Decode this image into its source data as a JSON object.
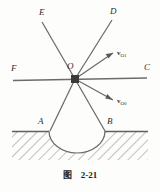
{
  "figure": {
    "caption_label": "图",
    "caption_number": "2-21",
    "type": "physics-ray-diagram"
  },
  "labels": {
    "E": "E",
    "D": "D",
    "F": "F",
    "C": "C",
    "O": "O",
    "A": "A",
    "B": "B"
  },
  "vectors": [
    {
      "name": "v_O1",
      "symbol": "v",
      "subscript": "O1",
      "direction": "up-right"
    },
    {
      "name": "v_O0",
      "symbol": "v",
      "subscript": "O0",
      "direction": "down-right"
    }
  ],
  "colors": {
    "line": "#6b6b6b",
    "node": "#3a3a3a",
    "hatch": "#7a7a7a",
    "text": "#2e2e2e",
    "background": "#fdfdfc"
  },
  "geometry": {
    "node_point": [
      75,
      79
    ],
    "horizontal_line": [
      [
        13,
        80
      ],
      [
        147,
        78
      ]
    ],
    "ray_E": [
      [
        42,
        22
      ],
      [
        75,
        79
      ]
    ],
    "ray_D": [
      [
        112,
        20
      ],
      [
        75,
        79
      ]
    ],
    "ray_A": [
      [
        50,
        130
      ],
      [
        75,
        79
      ]
    ],
    "ray_B": [
      [
        105,
        130
      ],
      [
        75,
        79
      ]
    ],
    "arrow_up": [
      [
        75,
        79
      ],
      [
        114,
        52
      ]
    ],
    "arrow_down": [
      [
        75,
        79
      ],
      [
        114,
        100
      ]
    ],
    "ground_y": 131,
    "cavity": {
      "center": [
        77,
        131
      ],
      "rx": 28,
      "ry": 22
    }
  }
}
